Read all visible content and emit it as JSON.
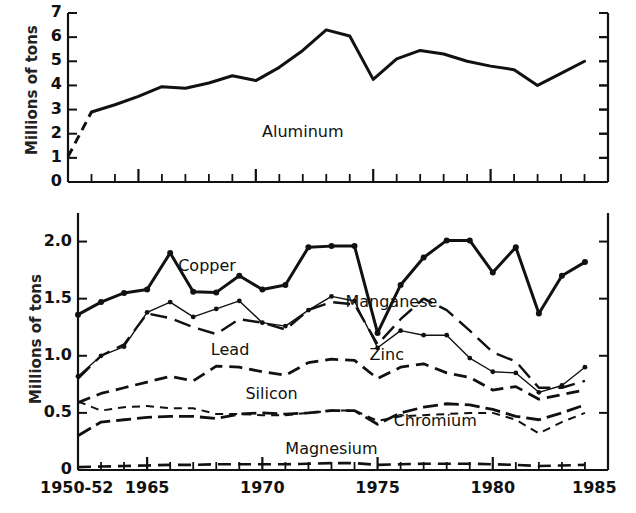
{
  "figure": {
    "background": "#ffffff",
    "ink": "#111111",
    "panels": 2
  },
  "chart_data": [
    {
      "type": "line",
      "panel": "top",
      "title": "",
      "xlabel": "",
      "ylabel": "Millions of tons",
      "ylim": [
        0,
        7
      ],
      "yticks": [
        0,
        1,
        2,
        3,
        4,
        5,
        6,
        7
      ],
      "ytick_labels": [
        "0",
        "1",
        "2",
        "3",
        "4",
        "5",
        "6",
        "7"
      ],
      "xlim": [
        1962,
        1985
      ],
      "xticks": [
        1965,
        1970,
        1975,
        1980,
        1985
      ],
      "xtick_labels": [
        "1950-52",
        "1965",
        "1970",
        "1975",
        "1980",
        "1985"
      ],
      "grid": false,
      "legend": "inline-annotations",
      "x": [
        1962,
        1963,
        1964,
        1965,
        1966,
        1967,
        1968,
        1969,
        1970,
        1971,
        1972,
        1973,
        1974,
        1975,
        1976,
        1977,
        1978,
        1979,
        1980,
        1981,
        1982,
        1983,
        1984
      ],
      "series": [
        {
          "name": "Aluminum",
          "marker": "none",
          "dash": "solid-with-leading-dash",
          "width": 3.0,
          "label_x": 1972.0,
          "label_y": 2.05,
          "values": [
            1.05,
            2.9,
            3.2,
            3.55,
            3.95,
            3.88,
            4.1,
            4.4,
            4.2,
            4.75,
            5.45,
            6.3,
            6.05,
            4.25,
            5.1,
            5.45,
            5.3,
            5.0,
            4.8,
            4.65,
            4.0,
            4.5,
            5.0
          ]
        }
      ]
    },
    {
      "type": "line",
      "panel": "bottom",
      "title": "",
      "xlabel": "",
      "ylabel": "Millions of tons",
      "ylim": [
        0,
        2.25
      ],
      "yticks": [
        0,
        0.5,
        1.0,
        1.5,
        2.0
      ],
      "ytick_labels": [
        "0",
        "0.5",
        "1.0",
        "1.5",
        "2.0"
      ],
      "xlim": [
        1962,
        1985
      ],
      "xticks": [
        1965,
        1970,
        1975,
        1980,
        1985
      ],
      "xtick_labels": [
        "1950-52",
        "1965",
        "1970",
        "1975",
        "1980",
        "1985"
      ],
      "grid": false,
      "legend": "inline-annotations",
      "x": [
        1962,
        1963,
        1964,
        1965,
        1966,
        1967,
        1968,
        1969,
        1970,
        1971,
        1972,
        1973,
        1974,
        1975,
        1976,
        1977,
        1978,
        1979,
        1980,
        1981,
        1982,
        1983,
        1984
      ],
      "series": [
        {
          "name": "Copper",
          "marker": "dot",
          "dash": "solid",
          "width": 3.0,
          "label_x": 1967.6,
          "label_y": 1.78,
          "values": [
            1.36,
            1.47,
            1.55,
            1.58,
            1.9,
            1.56,
            1.555,
            1.7,
            1.58,
            1.62,
            1.95,
            1.96,
            1.96,
            1.2,
            1.62,
            1.86,
            2.01,
            2.01,
            1.73,
            1.95,
            1.37,
            1.7,
            1.82
          ]
        },
        {
          "name": "Manganese",
          "marker": "none",
          "dash": "long-dash",
          "width": 2.4,
          "label_x": 1975.6,
          "label_y": 1.46,
          "values": [
            0.8,
            1.0,
            1.1,
            1.37,
            1.33,
            1.25,
            1.19,
            1.32,
            1.29,
            1.23,
            1.4,
            1.47,
            1.45,
            1.1,
            1.32,
            1.5,
            1.4,
            1.22,
            1.03,
            0.95,
            0.72,
            0.72,
            0.78
          ]
        },
        {
          "name": "Zinc",
          "marker": "dot",
          "dash": "thin-solid",
          "width": 1.4,
          "label_x": 1975.4,
          "label_y": 1.0,
          "values": [
            0.82,
            1.0,
            1.08,
            1.38,
            1.47,
            1.34,
            1.41,
            1.48,
            1.29,
            1.26,
            1.4,
            1.52,
            1.48,
            1.07,
            1.22,
            1.18,
            1.18,
            0.98,
            0.86,
            0.85,
            0.68,
            0.74,
            0.9
          ]
        },
        {
          "name": "Lead",
          "marker": "none",
          "dash": "dash",
          "width": 2.8,
          "label_x": 1968.6,
          "label_y": 1.04,
          "values": [
            0.59,
            0.67,
            0.72,
            0.77,
            0.82,
            0.78,
            0.91,
            0.9,
            0.86,
            0.83,
            0.94,
            0.97,
            0.96,
            0.8,
            0.9,
            0.93,
            0.85,
            0.81,
            0.7,
            0.73,
            0.62,
            0.66,
            0.7
          ]
        },
        {
          "name": "Silicon",
          "marker": "none",
          "dash": "dash-dot",
          "width": 2.8,
          "label_x": 1970.4,
          "label_y": 0.655,
          "values": [
            0.3,
            0.42,
            0.44,
            0.46,
            0.47,
            0.47,
            0.45,
            0.49,
            0.5,
            0.49,
            0.5,
            0.52,
            0.52,
            0.4,
            0.5,
            0.55,
            0.58,
            0.57,
            0.53,
            0.47,
            0.44,
            0.5,
            0.57
          ]
        },
        {
          "name": "Chromium",
          "marker": "none",
          "dash": "short-dash",
          "width": 2.0,
          "label_x": 1977.5,
          "label_y": 0.42,
          "values": [
            0.6,
            0.52,
            0.55,
            0.56,
            0.54,
            0.54,
            0.49,
            0.49,
            0.48,
            0.48,
            0.5,
            0.52,
            0.52,
            0.43,
            0.47,
            0.48,
            0.49,
            0.5,
            0.5,
            0.44,
            0.32,
            0.42,
            0.5
          ]
        },
        {
          "name": "Magnesium",
          "marker": "none",
          "dash": "dash",
          "width": 2.6,
          "label_x": 1973.0,
          "label_y": 0.175,
          "values": [
            0.025,
            0.03,
            0.035,
            0.04,
            0.045,
            0.045,
            0.05,
            0.05,
            0.05,
            0.05,
            0.055,
            0.06,
            0.06,
            0.045,
            0.05,
            0.055,
            0.055,
            0.055,
            0.05,
            0.045,
            0.035,
            0.04,
            0.045
          ]
        }
      ]
    }
  ]
}
